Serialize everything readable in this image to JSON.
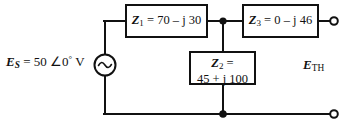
{
  "figure": {
    "type": "circuit-schematic",
    "background_color": "#ffffff",
    "line_color": "#111111"
  },
  "source": {
    "symbol": "ac-voltage-source",
    "name": "E_S",
    "label_name": "E",
    "label_sub": "S",
    "equals": " = ",
    "magnitude": "50",
    "angle_symbol": "∠",
    "angle_value": "0",
    "degree_symbol": "°",
    "unit": "V"
  },
  "components": [
    {
      "id": "Z1",
      "name": "Z",
      "sub": "1",
      "equals": " = ",
      "value": "70 – j 30",
      "real": 70,
      "imag": -30,
      "line1": "Z1 = 70 – j 30",
      "position": "series-top-left"
    },
    {
      "id": "Z3",
      "name": "Z",
      "sub": "3",
      "equals": " = ",
      "value": "0 – j 46",
      "real": 0,
      "imag": -46,
      "line1": "Z3 = 0 – j 46",
      "position": "series-top-right"
    },
    {
      "id": "Z2",
      "name": "Z",
      "sub": "2",
      "equals": " =",
      "value": "45 + j 100",
      "real": 45,
      "imag": 100,
      "line1": "Z2 =",
      "line2": "45 + j 100",
      "position": "shunt-middle"
    }
  ],
  "output": {
    "name": "E_TH",
    "label_name": "E",
    "label_sub": "TH"
  },
  "nodes": [
    {
      "name": "top-junction",
      "type": "filled",
      "x": 223,
      "y": 21
    },
    {
      "name": "bottom-junction",
      "type": "filled",
      "x": 223,
      "y": 114
    },
    {
      "name": "output-terminal-top",
      "type": "open",
      "x": 334,
      "y": 21
    },
    {
      "name": "output-terminal-bottom",
      "type": "open",
      "x": 334,
      "y": 114
    }
  ]
}
